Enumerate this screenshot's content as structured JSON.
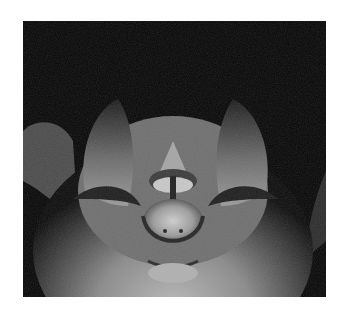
{
  "image": {
    "subject": "bat face close-up",
    "style": "grayscale photograph",
    "background_color": "#050505",
    "frame_color": "#ffffff"
  }
}
